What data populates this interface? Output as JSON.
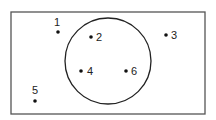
{
  "diagram": {
    "type": "venn-set-diagram",
    "universe": {
      "shape": "rectangle",
      "x": 11,
      "y": 12,
      "width": 194,
      "height": 102,
      "stroke": "#555555"
    },
    "set": {
      "shape": "circle",
      "cx": 108,
      "cy": 61,
      "r": 43,
      "stroke": "#222222"
    },
    "points": [
      {
        "label": "1",
        "dot": [
          58,
          32
        ],
        "text": [
          57,
          26
        ],
        "anchor": "middle",
        "inside_circle": false
      },
      {
        "label": "2",
        "dot": [
          91,
          37
        ],
        "text": [
          96,
          41
        ],
        "anchor": "start",
        "inside_circle": true
      },
      {
        "label": "3",
        "dot": [
          166,
          35
        ],
        "text": [
          171,
          39
        ],
        "anchor": "start",
        "inside_circle": false
      },
      {
        "label": "4",
        "dot": [
          81,
          71
        ],
        "text": [
          87,
          75
        ],
        "anchor": "start",
        "inside_circle": true
      },
      {
        "label": "5",
        "dot": [
          35,
          101
        ],
        "text": [
          35,
          94
        ],
        "anchor": "middle",
        "inside_circle": false
      },
      {
        "label": "6",
        "dot": [
          126,
          71
        ],
        "text": [
          131,
          75
        ],
        "anchor": "start",
        "inside_circle": true
      }
    ],
    "dot_color": "#111111",
    "dot_radius": 1.8
  }
}
